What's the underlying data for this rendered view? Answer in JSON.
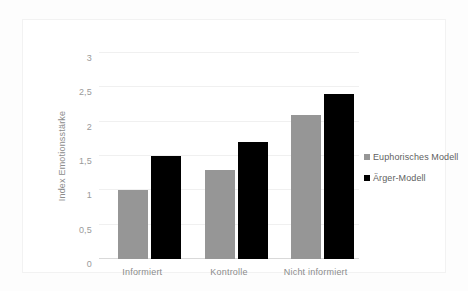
{
  "chart_data": {
    "type": "bar",
    "title": "",
    "subtitle": "",
    "xlabel": "",
    "ylabel": "Index Emotionsstärke",
    "categories": [
      "Informiert",
      "Kontrolle",
      "Nicht informiert"
    ],
    "series": [
      {
        "name": "Euphorisches Modell",
        "color": "#969696",
        "values": [
          1,
          1.3,
          2.1
        ]
      },
      {
        "name": "Ärger-Modell",
        "color": "#000000",
        "values": [
          1.5,
          1.7,
          2.4
        ]
      }
    ],
    "ylim": [
      0,
      3
    ],
    "ytick_values": [
      0,
      0.5,
      1,
      1.5,
      2,
      2.5,
      3
    ],
    "ytick_labels": [
      "0",
      "0,5",
      "1",
      "1,5",
      "2",
      "2,5",
      "3"
    ],
    "grid": true,
    "grid_axis": "y",
    "legend_position": "right",
    "background_color": "#ffffff",
    "grid_color": "#f0f0f0",
    "axis_text_color": "#9a9a9a"
  }
}
